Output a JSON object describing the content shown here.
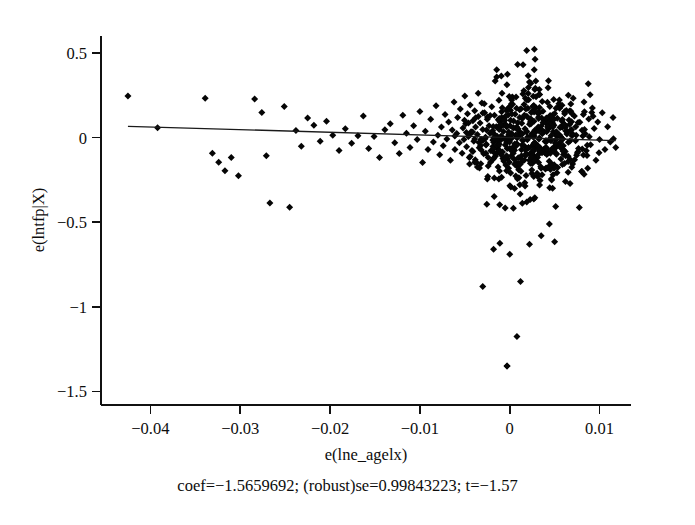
{
  "chart_data": {
    "type": "scatter",
    "title": "",
    "subtitle": "",
    "xlabel": "e(lne_agelx)",
    "ylabel": "e(lntfp|X)",
    "xlim": [
      -0.0455,
      0.0135
    ],
    "ylim": [
      -1.58,
      0.6
    ],
    "xticks": [
      -0.04,
      -0.03,
      -0.02,
      -0.01,
      0,
      0.01
    ],
    "xticklabels": [
      "−0.04",
      "−0.03",
      "−0.02",
      "−0.01",
      "0",
      "0.01"
    ],
    "yticks": [
      0.5,
      0,
      -0.5,
      -1,
      -1.5
    ],
    "yticklabels": [
      "0.5",
      "0",
      "−0.5",
      "−1",
      "−1.5"
    ],
    "grid": false,
    "legend": null,
    "marker": "diamond",
    "marker_color": "#050505",
    "marker_size": 7,
    "fit_line": {
      "type": "linear",
      "coef": -1.5659692,
      "robust_se": 0.99843223,
      "t": -1.57,
      "x_start": -0.0425,
      "y_start": 0.0666,
      "x_end": 0.0118,
      "y_end": -0.0184,
      "color": "#1a1a1a"
    },
    "annotation": "coef=−1.5659692; (robust)se=0.99843223; t=−1.57",
    "n_points": 612,
    "points": [
      [
        -0.0425,
        0.245
      ],
      [
        -0.0392,
        0.058
      ],
      [
        -0.0339,
        0.232
      ],
      [
        -0.0331,
        -0.093
      ],
      [
        -0.0324,
        -0.146
      ],
      [
        -0.0317,
        -0.196
      ],
      [
        -0.031,
        -0.118
      ],
      [
        -0.0302,
        -0.226
      ],
      [
        -0.0284,
        0.228
      ],
      [
        -0.0276,
        0.148
      ],
      [
        -0.0271,
        -0.108
      ],
      [
        -0.0267,
        -0.386
      ],
      [
        -0.0251,
        0.184
      ],
      [
        -0.0245,
        -0.411
      ],
      [
        -0.0238,
        0.042
      ],
      [
        -0.0232,
        -0.052
      ],
      [
        -0.0225,
        0.116
      ],
      [
        -0.0218,
        0.072
      ],
      [
        -0.0211,
        -0.022
      ],
      [
        -0.0204,
        0.096
      ],
      [
        -0.0197,
        0.014
      ],
      [
        -0.019,
        -0.076
      ],
      [
        -0.0183,
        0.052
      ],
      [
        -0.0176,
        -0.034
      ],
      [
        -0.0169,
        0.01
      ],
      [
        -0.0163,
        0.128
      ],
      [
        -0.0157,
        -0.064
      ],
      [
        -0.0151,
        0.006
      ],
      [
        -0.0145,
        -0.118
      ],
      [
        -0.0139,
        0.046
      ],
      [
        -0.0133,
        0.082
      ],
      [
        -0.0128,
        -0.03
      ],
      [
        -0.0123,
        -0.094
      ],
      [
        -0.0119,
        0.132
      ],
      [
        -0.0115,
        0.026
      ],
      [
        -0.0111,
        -0.058
      ],
      [
        -0.0107,
        0.07
      ],
      [
        -0.0103,
        -0.012
      ],
      [
        -0.01,
        0.154
      ],
      [
        -0.0097,
        -0.148
      ],
      [
        -0.0094,
        0.038
      ],
      [
        -0.0091,
        -0.07
      ],
      [
        -0.0088,
        0.108
      ],
      [
        -0.0085,
        -0.026
      ],
      [
        -0.0082,
        0.188
      ],
      [
        -0.008,
        0.014
      ],
      [
        -0.0078,
        -0.102
      ],
      [
        -0.0076,
        0.062
      ],
      [
        -0.0074,
        -0.048
      ],
      [
        -0.0072,
        0.136
      ],
      [
        -0.007,
        -0.008
      ],
      [
        -0.0068,
        0.092
      ],
      [
        -0.0066,
        -0.134
      ],
      [
        -0.0064,
        0.044
      ],
      [
        -0.0062,
        0.21
      ],
      [
        -0.0061,
        -0.07
      ],
      [
        -0.0059,
        0.024
      ],
      [
        -0.0058,
        0.118
      ],
      [
        -0.0056,
        -0.03
      ],
      [
        -0.0055,
        0.168
      ],
      [
        -0.0053,
        -0.092
      ],
      [
        -0.0052,
        0.056
      ],
      [
        -0.0051,
        -0.012
      ],
      [
        -0.005,
        0.246
      ],
      [
        -0.0049,
        0.082
      ],
      [
        -0.0048,
        -0.054
      ],
      [
        -0.0047,
        0.14
      ],
      [
        -0.0046,
        0.006
      ],
      [
        -0.0045,
        -0.118
      ],
      [
        -0.0044,
        0.192
      ],
      [
        -0.0043,
        0.034
      ],
      [
        -0.0042,
        -0.076
      ],
      [
        -0.0041,
        0.1
      ],
      [
        -0.004,
        -0.022
      ],
      [
        -0.0039,
        0.158
      ],
      [
        -0.0038,
        0.062
      ],
      [
        -0.0037,
        -0.148
      ],
      [
        -0.0036,
        0.018
      ],
      [
        -0.0035,
        0.124
      ],
      [
        -0.0034,
        -0.06
      ],
      [
        -0.0033,
        0.086
      ],
      [
        -0.0032,
        -0.01
      ],
      [
        -0.0031,
        0.204
      ],
      [
        -0.003,
        0.048
      ],
      [
        -0.0029,
        -0.096
      ],
      [
        -0.0028,
        0.146
      ],
      [
        -0.0027,
        0.002
      ],
      [
        -0.0026,
        -0.04
      ],
      [
        -0.0025,
        0.108
      ],
      [
        -0.0024,
        -0.168
      ],
      [
        -0.0023,
        0.07
      ],
      [
        -0.0022,
        0.026
      ],
      [
        -0.0021,
        -0.078
      ],
      [
        -0.002,
        0.182
      ],
      [
        -0.0019,
        0.04
      ],
      [
        -0.0018,
        -0.028
      ],
      [
        -0.0017,
        0.132
      ],
      [
        -0.0016,
        -0.11
      ],
      [
        -0.0015,
        0.064
      ],
      [
        -0.0014,
        0.008
      ],
      [
        -0.0013,
        -0.052
      ],
      [
        -0.0012,
        0.22
      ],
      [
        -0.0011,
        0.094
      ],
      [
        -0.001,
        -0.014
      ],
      [
        -0.0009,
        0.152
      ],
      [
        -0.0008,
        -0.086
      ],
      [
        -0.0007,
        0.036
      ],
      [
        -0.0006,
        0.116
      ],
      [
        -0.0005,
        -0.044
      ],
      [
        -0.0004,
        0.074
      ],
      [
        -0.0003,
        -1.35
      ],
      [
        -0.0002,
        0.17
      ],
      [
        -0.0001,
        0.02
      ],
      [
        0.0,
        -0.066
      ],
      [
        0.0001,
        0.102
      ],
      [
        0.0002,
        -0.006
      ],
      [
        0.0003,
        0.24
      ],
      [
        0.0004,
        0.058
      ],
      [
        0.0005,
        -0.128
      ],
      [
        0.0006,
        0.138
      ],
      [
        0.0007,
        0.012
      ],
      [
        0.0008,
        -0.036
      ],
      [
        0.0009,
        0.088
      ],
      [
        0.001,
        -0.19
      ],
      [
        0.0011,
        0.164
      ],
      [
        0.0012,
        0.03
      ],
      [
        0.0013,
        -0.072
      ],
      [
        0.0014,
        0.112
      ],
      [
        0.0015,
        -0.018
      ],
      [
        0.0016,
        0.196
      ],
      [
        0.0017,
        0.052
      ],
      [
        0.0018,
        -0.104
      ],
      [
        0.0019,
        0.126
      ],
      [
        0.002,
        0.004
      ],
      [
        0.0021,
        -0.058
      ],
      [
        0.0022,
        0.078
      ],
      [
        0.0023,
        -0.152
      ],
      [
        0.0024,
        0.148
      ],
      [
        0.0025,
        0.024
      ],
      [
        0.0026,
        -0.082
      ],
      [
        0.0027,
        0.096
      ],
      [
        0.0028,
        -0.03
      ],
      [
        0.0029,
        0.178
      ],
      [
        0.003,
        0.042
      ],
      [
        0.0031,
        -0.118
      ],
      [
        0.0032,
        0.12
      ],
      [
        0.0033,
        -0.002
      ],
      [
        0.0034,
        -0.062
      ],
      [
        0.0035,
        0.068
      ],
      [
        0.0036,
        -0.22
      ],
      [
        0.0037,
        0.156
      ],
      [
        0.0038,
        0.034
      ],
      [
        0.0039,
        -0.09
      ],
      [
        0.004,
        0.106
      ],
      [
        0.0041,
        -0.024
      ],
      [
        0.0042,
        0.208
      ],
      [
        0.0043,
        0.05
      ],
      [
        0.0044,
        -0.14
      ],
      [
        0.0045,
        0.13
      ],
      [
        0.0046,
        0.01
      ],
      [
        0.0047,
        -0.068
      ],
      [
        0.0048,
        0.084
      ],
      [
        0.0049,
        -0.178
      ],
      [
        0.005,
        0.142
      ],
      [
        0.0051,
        0.028
      ],
      [
        0.0052,
        -0.098
      ],
      [
        0.0053,
        0.114
      ],
      [
        0.0054,
        -0.04
      ],
      [
        0.0055,
        0.186
      ],
      [
        0.0056,
        0.06
      ],
      [
        0.0057,
        -0.126
      ],
      [
        0.0058,
        0.098
      ],
      [
        0.0059,
        -0.008
      ],
      [
        0.006,
        -0.076
      ],
      [
        0.0061,
        0.072
      ],
      [
        0.0062,
        -0.26
      ],
      [
        0.0063,
        0.16
      ],
      [
        0.0064,
        0.038
      ],
      [
        0.0065,
        -0.11
      ],
      [
        0.0066,
        0.104
      ],
      [
        0.0067,
        -0.02
      ],
      [
        0.0068,
        0.198
      ],
      [
        0.0069,
        0.046
      ],
      [
        0.007,
        -0.156
      ],
      [
        0.0072,
        0.128
      ],
      [
        0.0074,
        0.014
      ],
      [
        0.0076,
        -0.084
      ],
      [
        0.0078,
        0.09
      ],
      [
        0.008,
        -0.2
      ],
      [
        0.0082,
        0.136
      ],
      [
        0.0084,
        0.022
      ],
      [
        0.0086,
        -0.106
      ],
      [
        0.0088,
        0.11
      ],
      [
        0.009,
        -0.042
      ],
      [
        0.0092,
        0.174
      ],
      [
        0.0094,
        0.054
      ],
      [
        0.0096,
        -0.134
      ],
      [
        0.0098,
        0.092
      ],
      [
        0.01,
        -0.012
      ],
      [
        0.0103,
        0.146
      ],
      [
        0.0106,
        -0.07
      ],
      [
        0.0109,
        0.064
      ],
      [
        0.0112,
        -0.026
      ],
      [
        0.0115,
        0.118
      ],
      [
        0.0118,
        -0.058
      ]
    ],
    "outliers": [
      [
        -0.0003,
        -1.35
      ],
      [
        0.0008,
        -1.175
      ],
      [
        -0.003,
        -0.88
      ],
      [
        0.0012,
        -0.85
      ],
      [
        -0.0018,
        -0.66
      ],
      [
        0.0,
        -0.69
      ],
      [
        -0.0011,
        -0.625
      ],
      [
        0.0022,
        -0.63
      ],
      [
        0.0035,
        -0.58
      ],
      [
        0.005,
        -0.615
      ]
    ]
  }
}
